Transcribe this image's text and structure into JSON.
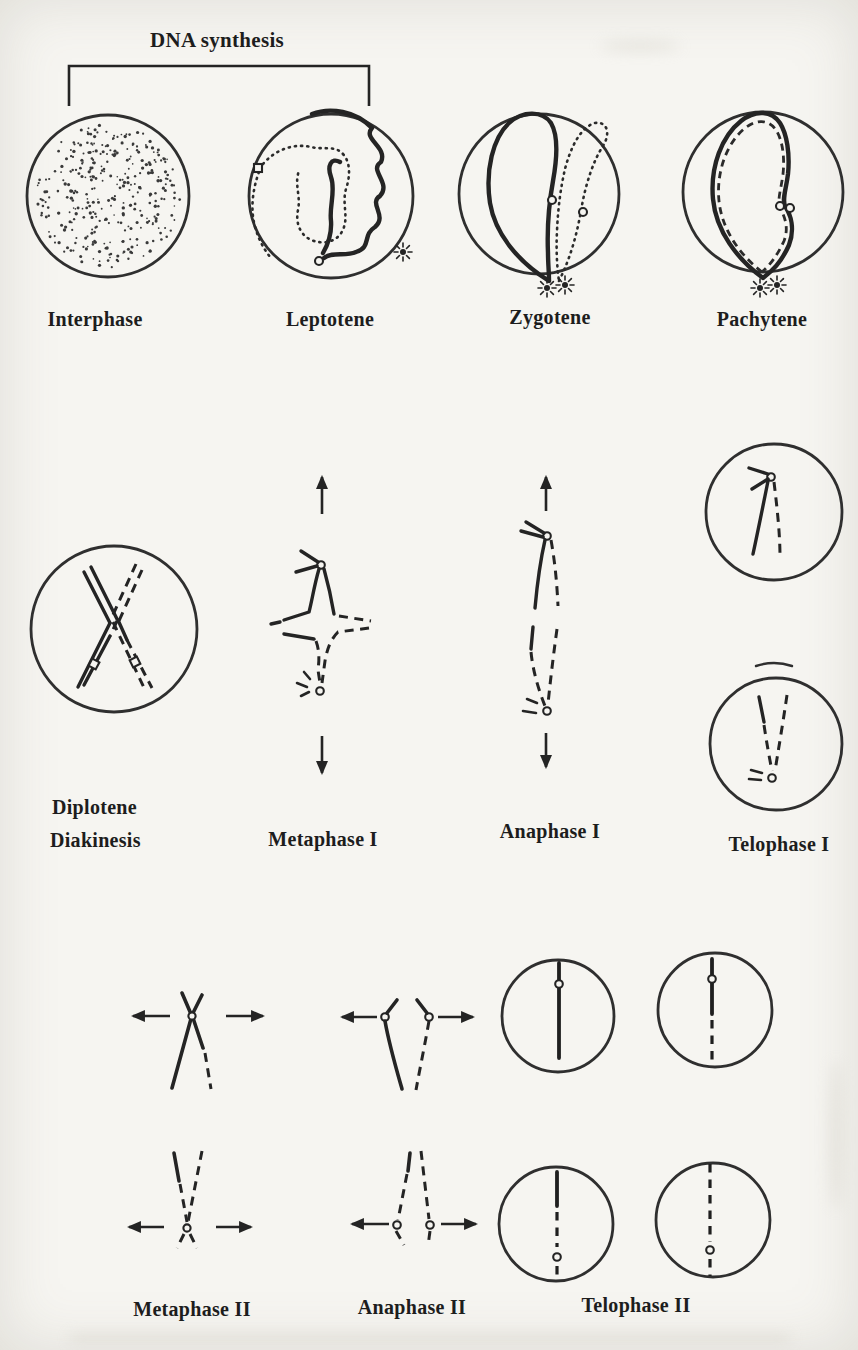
{
  "figure": {
    "bracket_label": "DNA synthesis",
    "labels": {
      "interphase": "Interphase",
      "leptotene": "Leptotene",
      "zygotene": "Zygotene",
      "pachytene": "Pachytene",
      "diplotene": "Diplotene",
      "diakinesis": "Diakinesis",
      "metaphase_i": "Metaphase I",
      "anaphase_i": "Anaphase I",
      "telophase_i": "Telophase I",
      "metaphase_ii": "Metaphase II",
      "anaphase_ii": "Anaphase II",
      "telophase_ii": "Telophase II"
    },
    "colors": {
      "ink": "#242424",
      "paper": "#f6f5f1"
    }
  }
}
